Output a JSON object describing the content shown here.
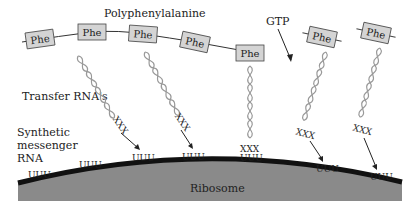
{
  "labels": {
    "polymer": "Polyphenylalanine",
    "gtp": "GTP",
    "trna": "Transfer RNA's",
    "mrna_line1": "Synthetic",
    "mrna_line2": "messenger",
    "mrna_line3": "RNA",
    "ribosome": "Ribosome"
  },
  "amino_acid": "Phe",
  "anticodon": "XXX",
  "codon": "UUU",
  "colors": {
    "ribosome_fill": "#8a8a8a",
    "mrna_strand": "#111111",
    "phe_box_fill": "#d4d4d4",
    "helix": "#999999"
  },
  "phe_boxes": [
    {
      "x": 40,
      "y": 38,
      "rot": -8
    },
    {
      "x": 92,
      "y": 32,
      "rot": 0
    },
    {
      "x": 143,
      "y": 34,
      "rot": 4
    },
    {
      "x": 195,
      "y": 41,
      "rot": 10
    },
    {
      "x": 250,
      "y": 52,
      "rot": 0
    },
    {
      "x": 320,
      "y": 38,
      "rot": 10
    },
    {
      "x": 375,
      "y": 34,
      "rot": 10
    }
  ],
  "codons": [
    {
      "x": 40,
      "y": 170
    },
    {
      "x": 92,
      "y": 160
    },
    {
      "x": 143,
      "y": 153
    },
    {
      "x": 195,
      "y": 153
    },
    {
      "x": 250,
      "y": 154
    },
    {
      "x": 327,
      "y": 166
    },
    {
      "x": 382,
      "y": 174
    }
  ]
}
